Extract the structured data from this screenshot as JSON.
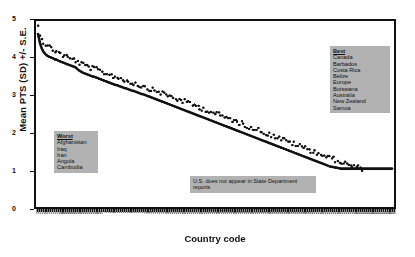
{
  "chart_data": {
    "type": "line",
    "title": "",
    "xlabel": "Country code",
    "ylabel": "Mean PTS (SD) +/- S.E.",
    "ylim": [
      0,
      5
    ],
    "yticks": [
      0,
      1,
      2,
      3,
      4,
      5
    ],
    "grid": false,
    "legend_position": "inside-right",
    "n_points": 150,
    "x_tick_labels": [
      "700",
      "710",
      "713",
      "731",
      "732",
      "740",
      "750",
      "770",
      "771",
      "775",
      "780",
      "790",
      "800",
      "811",
      "812",
      "816",
      "820",
      "830",
      "835",
      "840",
      "850",
      "900",
      "910",
      "920",
      "940",
      "950",
      "955",
      "970",
      "971",
      "972",
      "973",
      "983",
      "986",
      "987",
      "990",
      "2",
      "20",
      "31",
      "40",
      "41",
      "42",
      "51",
      "52",
      "53",
      "54",
      "55",
      "56",
      "57",
      "58",
      "70",
      "80",
      "90",
      "91",
      "92",
      "93",
      "94",
      "95",
      "100",
      "101",
      "110",
      "115",
      "130",
      "135",
      "140",
      "145",
      "150",
      "155",
      "160",
      "165",
      "200",
      "205",
      "210",
      "211",
      "212",
      "220",
      "225",
      "230",
      "235",
      "240",
      "245",
      "255",
      "265",
      "267",
      "269",
      "271",
      "273",
      "275",
      "280",
      "290",
      "305",
      "310",
      "315",
      "316",
      "317",
      "325",
      "338",
      "339",
      "341",
      "343",
      "344",
      "345",
      "346",
      "349",
      "350",
      "352",
      "355",
      "359",
      "360",
      "365",
      "366",
      "367",
      "368",
      "369",
      "370",
      "371",
      "372",
      "373",
      "375",
      "380",
      "385",
      "390",
      "395",
      "402",
      "403",
      "404",
      "411",
      "420",
      "432",
      "433",
      "434",
      "435",
      "436",
      "437",
      "438",
      "439",
      "450",
      "451",
      "452",
      "461",
      "471",
      "475",
      "481",
      "482",
      "483",
      "484",
      "490",
      "500",
      "501",
      "510",
      "516",
      "517",
      "520",
      "522",
      "530",
      "531",
      "540",
      "541",
      "551",
      "552",
      "553",
      "560",
      "565",
      "570",
      "571",
      "572",
      "580",
      "581",
      "590",
      "591",
      "600",
      "615",
      "616",
      "620",
      "625",
      "626",
      "630",
      "645",
      "651",
      "652",
      "660",
      "663",
      "666",
      "670",
      "678",
      "680",
      "690",
      "692",
      "694",
      "696",
      "698"
    ],
    "series": [
      {
        "name": "Mean PTS (SD)",
        "style": "solid-line",
        "values": [
          4.7,
          4.46,
          4.3,
          4.2,
          4.14,
          4.1,
          4.07,
          4.05,
          4.03,
          4.0,
          3.99,
          3.96,
          3.94,
          3.92,
          3.9,
          3.88,
          3.86,
          3.84,
          3.82,
          3.8,
          3.78,
          3.73,
          3.69,
          3.66,
          3.63,
          3.61,
          3.59,
          3.57,
          3.55,
          3.53,
          3.52,
          3.5,
          3.48,
          3.46,
          3.44,
          3.42,
          3.4,
          3.38,
          3.36,
          3.34,
          3.32,
          3.3,
          3.29,
          3.27,
          3.25,
          3.23,
          3.21,
          3.2,
          3.18,
          3.16,
          3.14,
          3.13,
          3.11,
          3.09,
          3.07,
          3.05,
          3.04,
          3.02,
          3.0,
          2.98,
          2.96,
          2.94,
          2.92,
          2.9,
          2.88,
          2.86,
          2.84,
          2.82,
          2.8,
          2.78,
          2.76,
          2.74,
          2.72,
          2.7,
          2.68,
          2.66,
          2.64,
          2.62,
          2.6,
          2.58,
          2.56,
          2.54,
          2.52,
          2.5,
          2.48,
          2.46,
          2.44,
          2.42,
          2.4,
          2.38,
          2.36,
          2.34,
          2.32,
          2.3,
          2.28,
          2.26,
          2.24,
          2.22,
          2.2,
          2.18,
          2.16,
          2.14,
          2.12,
          2.1,
          2.08,
          2.06,
          2.04,
          2.02,
          2.0,
          1.98,
          1.96,
          1.94,
          1.92,
          1.9,
          1.88,
          1.86,
          1.84,
          1.82,
          1.8,
          1.78,
          1.76,
          1.74,
          1.72,
          1.7,
          1.68,
          1.66,
          1.64,
          1.62,
          1.6,
          1.58,
          1.56,
          1.54,
          1.52,
          1.5,
          1.48,
          1.46,
          1.44,
          1.42,
          1.4,
          1.38,
          1.36,
          1.34,
          1.32,
          1.3,
          1.28,
          1.26,
          1.24,
          1.22,
          1.2,
          1.18,
          1.16,
          1.14,
          1.12,
          1.1,
          1.08,
          1.06,
          1.05,
          1.04,
          1.03,
          1.02,
          1.01,
          1.0,
          1.0,
          1.0,
          1.0,
          1.0,
          1.0,
          1.0,
          1.0,
          1.0,
          1.0,
          1.0,
          1.0,
          1.0,
          1.0,
          1.0,
          1.0,
          1.0,
          1.0,
          1.0,
          1.0,
          1.0,
          1.0,
          1.0,
          1.0,
          1.0,
          1.0,
          1.0,
          1.0
        ]
      },
      {
        "name": "Upper S.E.",
        "style": "dots",
        "values": [
          4.9,
          4.72,
          4.58,
          4.48,
          4.42,
          4.36,
          4.34,
          4.3,
          4.28,
          4.24,
          4.22,
          4.18,
          4.16,
          4.12,
          4.1,
          4.08,
          4.05,
          4.03,
          4.01,
          3.99,
          3.97,
          3.93,
          3.9,
          3.87,
          3.85,
          3.83,
          3.81,
          3.79,
          3.77,
          3.75,
          3.74,
          3.72,
          3.7,
          3.68,
          3.66,
          3.64,
          3.62,
          3.6,
          3.58,
          3.56,
          3.55,
          3.53,
          3.51,
          3.49,
          3.47,
          3.45,
          3.43,
          3.42,
          3.4,
          3.38,
          3.36,
          3.35,
          3.33,
          3.31,
          3.29,
          3.27,
          3.26,
          3.24,
          3.22,
          3.2,
          3.18,
          3.16,
          3.15,
          3.13,
          3.11,
          3.09,
          3.07,
          3.05,
          3.03,
          3.01,
          2.99,
          2.97,
          2.95,
          2.93,
          2.91,
          2.89,
          2.88,
          2.86,
          2.84,
          2.82,
          2.8,
          2.78,
          2.76,
          2.74,
          2.72,
          2.7,
          2.68,
          2.66,
          2.64,
          2.62,
          2.6,
          2.58,
          2.56,
          2.54,
          2.52,
          2.5,
          2.48,
          2.46,
          2.44,
          2.42,
          2.4,
          2.38,
          2.36,
          2.34,
          2.32,
          2.3,
          2.28,
          2.26,
          2.24,
          2.22,
          2.2,
          2.18,
          2.16,
          2.14,
          2.12,
          2.1,
          2.08,
          2.06,
          2.04,
          2.02,
          2.0,
          1.98,
          1.96,
          1.94,
          1.92,
          1.9,
          1.88,
          1.86,
          1.84,
          1.82,
          1.8,
          1.78,
          1.76,
          1.74,
          1.72,
          1.7,
          1.68,
          1.66,
          1.64,
          1.62,
          1.6,
          1.58,
          1.56,
          1.54,
          1.52,
          1.5,
          1.48,
          1.46,
          1.44,
          1.42,
          1.4,
          1.38,
          1.36,
          1.34,
          1.32,
          1.3,
          1.28,
          1.26,
          1.24,
          1.22,
          1.2,
          1.18,
          1.16,
          1.14,
          1.12,
          1.1,
          1.08,
          1.06,
          1.05,
          1.04,
          1.03,
          1.02,
          1.01,
          1.0,
          1.0,
          1.0,
          1.0,
          1.0,
          1.0,
          1.0,
          1.0,
          1.0,
          1.0,
          1.0,
          1.0,
          1.0,
          1.0,
          1.0,
          1.0
        ]
      }
    ],
    "annotations": {
      "best": {
        "header": "Best",
        "items": [
          "Canada",
          "Barbados",
          "Costa Rica",
          "Belize",
          "Europe",
          "Botswana",
          "Australia",
          "New Zealand",
          "Samoa"
        ]
      },
      "worst": {
        "header": "Worst",
        "items": [
          "Afghanistan",
          "Iraq",
          "Iran",
          "Angola",
          "Cambodia"
        ]
      },
      "note": "U.S. does not appear in State Department reports"
    },
    "colors": {
      "line": "#111111",
      "dots": "#111111",
      "axis": "#111111",
      "box_background": "#b2b2b2",
      "plot_background": "#ffffff"
    }
  }
}
